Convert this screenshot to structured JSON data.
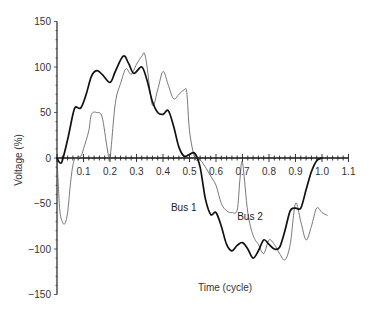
{
  "chart_data": {
    "type": "line",
    "title": "",
    "xlabel": "Time (cycle)",
    "ylabel": "Voltage (%)",
    "xlim": [
      0,
      1.1
    ],
    "ylim": [
      -150,
      150
    ],
    "grid": false,
    "legend_position": "inline",
    "x_ticks": [
      "0.1",
      "0.2",
      "0.3",
      "0.4",
      "0.5",
      "0.6",
      "0.7",
      "0.8",
      "0.9",
      "1.0",
      "1.1"
    ],
    "x_tick_values": [
      0.1,
      0.2,
      0.3,
      0.4,
      0.5,
      0.6,
      0.7,
      0.8,
      0.9,
      1.0,
      1.1
    ],
    "y_ticks": [
      "150",
      "100",
      "50",
      "0",
      "−50",
      "−100",
      "−150"
    ],
    "y_tick_values": [
      150,
      100,
      50,
      0,
      -50,
      -100,
      -150
    ],
    "series": [
      {
        "name": "Bus 1",
        "style": "thick",
        "color": "#111111",
        "label_pos": [
          0.43,
          -58
        ],
        "x": [
          0,
          0.01,
          0.02,
          0.04,
          0.06,
          0.07,
          0.09,
          0.11,
          0.13,
          0.15,
          0.17,
          0.2,
          0.22,
          0.25,
          0.27,
          0.29,
          0.32,
          0.34,
          0.36,
          0.38,
          0.4,
          0.42,
          0.44,
          0.46,
          0.48,
          0.5,
          0.52,
          0.54,
          0.56,
          0.58,
          0.6,
          0.62,
          0.64,
          0.66,
          0.68,
          0.7,
          0.72,
          0.74,
          0.76,
          0.78,
          0.8,
          0.82,
          0.84,
          0.86,
          0.88,
          0.9,
          0.92,
          0.94,
          0.96,
          0.98,
          1.0
        ],
        "values": [
          0,
          -5,
          -3,
          20,
          48,
          56,
          55,
          70,
          90,
          96,
          92,
          83,
          95,
          112,
          104,
          93,
          100,
          85,
          62,
          50,
          48,
          52,
          35,
          12,
          2,
          4,
          5,
          -10,
          -45,
          -62,
          -60,
          -75,
          -95,
          -102,
          -96,
          -93,
          -100,
          -110,
          -102,
          -90,
          -95,
          -100,
          -98,
          -80,
          -58,
          -55,
          -55,
          -35,
          -15,
          -3,
          0
        ]
      },
      {
        "name": "Bus 2",
        "style": "thin",
        "color": "#555555",
        "label_pos": [
          0.68,
          -68
        ],
        "x": [
          0,
          0.01,
          0.02,
          0.03,
          0.04,
          0.05,
          0.06,
          0.07,
          0.09,
          0.1,
          0.12,
          0.13,
          0.15,
          0.17,
          0.19,
          0.2,
          0.22,
          0.24,
          0.26,
          0.28,
          0.3,
          0.32,
          0.33,
          0.34,
          0.36,
          0.38,
          0.4,
          0.42,
          0.44,
          0.46,
          0.48,
          0.49,
          0.5,
          0.52,
          0.54,
          0.56,
          0.58,
          0.6,
          0.62,
          0.64,
          0.66,
          0.68,
          0.69,
          0.7,
          0.72,
          0.74,
          0.76,
          0.78,
          0.8,
          0.82,
          0.84,
          0.86,
          0.88,
          0.9,
          0.92,
          0.94,
          0.96,
          0.98,
          1.0,
          1.02
        ],
        "values": [
          0,
          -55,
          -70,
          -72,
          -60,
          -30,
          -8,
          0,
          2,
          10,
          30,
          48,
          50,
          45,
          10,
          0,
          60,
          82,
          98,
          92,
          103,
          112,
          115,
          100,
          58,
          75,
          95,
          80,
          65,
          70,
          75,
          72,
          30,
          0,
          -2,
          -10,
          -20,
          -30,
          -50,
          -58,
          -60,
          -57,
          -25,
          -5,
          -60,
          -85,
          -95,
          -105,
          -90,
          -95,
          -105,
          -112,
          -95,
          -50,
          -70,
          -90,
          -75,
          -55,
          -60,
          -63
        ]
      }
    ]
  }
}
